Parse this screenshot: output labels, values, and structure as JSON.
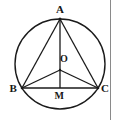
{
  "figure": {
    "background_color": "#ffffff",
    "stroke_color": "#1a1a1a",
    "label_color": "#161616",
    "rule_color": "#8a8a8a",
    "labels": {
      "apex": "A",
      "center": "O",
      "left_vertex": "B",
      "midpoint": "M",
      "right_vertex": "C"
    }
  },
  "chart_data": {
    "type": "diagram",
    "canvas": {
      "width": 120,
      "height": 120
    },
    "circle": {
      "cx": 60,
      "cy": 64,
      "r": 45
    },
    "points": [
      {
        "name": "A",
        "x": 60,
        "y": 19,
        "label": "A",
        "label_x": 60,
        "label_y": 9
      },
      {
        "name": "O",
        "x": 60,
        "y": 70,
        "label": "O",
        "label_x": 64,
        "label_y": 59
      },
      {
        "name": "B",
        "x": 22,
        "y": 88,
        "label": "B",
        "label_x": 13,
        "label_y": 88
      },
      {
        "name": "M",
        "x": 60,
        "y": 88,
        "label": "M",
        "label_x": 59,
        "label_y": 96
      },
      {
        "name": "C",
        "x": 98,
        "y": 88,
        "label": "C",
        "label_x": 105,
        "label_y": 88
      }
    ],
    "segments": [
      {
        "name": "AB",
        "from": "A",
        "to": "B"
      },
      {
        "name": "AC",
        "from": "A",
        "to": "C"
      },
      {
        "name": "BC",
        "from": "B",
        "to": "C"
      },
      {
        "name": "AM",
        "from": "A",
        "to": "M"
      },
      {
        "name": "OB",
        "from": "O",
        "to": "B"
      },
      {
        "name": "OC",
        "from": "O",
        "to": "C"
      }
    ],
    "border_rule": {
      "orientation": "vertical",
      "x": 110,
      "y1": 0,
      "y2": 120
    }
  }
}
